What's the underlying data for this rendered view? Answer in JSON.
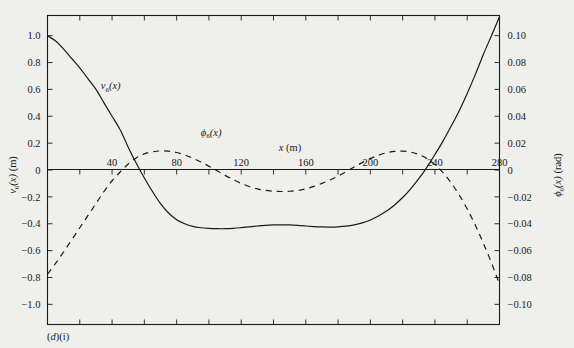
{
  "caption": "(d)(i)",
  "chart_data": {
    "type": "line",
    "title": "",
    "xlabel": "x (m)",
    "ylabel_left": "v₆(x) (m)",
    "ylabel_right": "ϕ₆(x) (rad)",
    "xlim": [
      0,
      280
    ],
    "ylim_left": [
      -1.15,
      1.15
    ],
    "ylim_right": [
      -0.115,
      0.115
    ],
    "grid": false,
    "legend": "inline-curve-labels",
    "xticks_major": [
      40,
      80,
      120,
      160,
      200,
      240,
      280
    ],
    "xticks_minor": [
      20,
      60,
      100,
      140,
      180,
      220,
      260
    ],
    "yticks_left": [
      "1.0",
      "0.8",
      "0.6",
      "0.4",
      "0.2",
      "0",
      "-0.2",
      "-0.4",
      "-0.6",
      "-0.8",
      "-1.0"
    ],
    "yticks_left_values": [
      1.0,
      0.8,
      0.6,
      0.4,
      0.2,
      0,
      -0.2,
      -0.4,
      -0.6,
      -0.8,
      -1.0
    ],
    "yticks_right": [
      "0.10",
      "0.08",
      "0.06",
      "0.04",
      "0.02",
      "0",
      "-0.02",
      "-0.04",
      "-0.06",
      "-0.08",
      "-0.10"
    ],
    "yticks_right_values": [
      0.1,
      0.08,
      0.06,
      0.04,
      0.02,
      0,
      -0.02,
      -0.04,
      -0.06,
      -0.08,
      -0.1
    ],
    "series": [
      {
        "name": "v6(x)",
        "label_html": "v<sub>6</sub>(x)",
        "style": "solid",
        "axis": "left",
        "units": "m",
        "label_pos": {
          "x": 33,
          "y": 0.6
        },
        "x": [
          0,
          5,
          10,
          15,
          20,
          25,
          30,
          35,
          40,
          45,
          50,
          55,
          60,
          65,
          70,
          75,
          80,
          85,
          90,
          95,
          100,
          105,
          110,
          115,
          120,
          125,
          130,
          135,
          140,
          145,
          150,
          155,
          160,
          165,
          170,
          175,
          180,
          185,
          190,
          195,
          200,
          205,
          210,
          215,
          220,
          225,
          230,
          235,
          240,
          245,
          250,
          255,
          260,
          265,
          270,
          275,
          280
        ],
        "y": [
          1.0,
          0.96,
          0.9,
          0.83,
          0.76,
          0.68,
          0.6,
          0.5,
          0.4,
          0.3,
          0.17,
          0.05,
          -0.06,
          -0.16,
          -0.25,
          -0.32,
          -0.37,
          -0.4,
          -0.42,
          -0.43,
          -0.435,
          -0.437,
          -0.437,
          -0.434,
          -0.429,
          -0.423,
          -0.417,
          -0.412,
          -0.409,
          -0.408,
          -0.409,
          -0.412,
          -0.417,
          -0.421,
          -0.424,
          -0.425,
          -0.423,
          -0.418,
          -0.408,
          -0.393,
          -0.372,
          -0.343,
          -0.306,
          -0.26,
          -0.205,
          -0.14,
          -0.065,
          0.02,
          0.115,
          0.215,
          0.325,
          0.44,
          0.57,
          0.71,
          0.86,
          1.0,
          1.14
        ]
      },
      {
        "name": "phi6(x)",
        "label_html": "ϕ<sub>6</sub>(x)",
        "style": "dashed",
        "axis": "right",
        "units": "rad",
        "label_pos": {
          "x": 95,
          "y": 0.0255
        },
        "x": [
          0,
          5,
          10,
          15,
          20,
          25,
          30,
          35,
          40,
          45,
          50,
          55,
          60,
          65,
          70,
          75,
          80,
          85,
          90,
          95,
          100,
          105,
          110,
          115,
          120,
          125,
          130,
          135,
          140,
          145,
          150,
          155,
          160,
          165,
          170,
          175,
          180,
          185,
          190,
          195,
          200,
          205,
          210,
          215,
          220,
          225,
          230,
          235,
          240,
          245,
          250,
          255,
          260,
          265,
          270,
          275,
          280
        ],
        "y": [
          -0.0775,
          -0.0695,
          -0.061,
          -0.052,
          -0.043,
          -0.034,
          -0.025,
          -0.016,
          -0.008,
          -0.0015,
          0.0045,
          0.009,
          0.012,
          0.0135,
          0.0142,
          0.014,
          0.013,
          0.0112,
          0.0088,
          0.006,
          0.0028,
          -0.0005,
          -0.004,
          -0.0072,
          -0.01,
          -0.0123,
          -0.014,
          -0.0152,
          -0.0158,
          -0.016,
          -0.0158,
          -0.0152,
          -0.014,
          -0.0122,
          -0.01,
          -0.0074,
          -0.0045,
          -0.0012,
          0.0022,
          0.0055,
          0.0085,
          0.011,
          0.0128,
          0.0138,
          0.014,
          0.0133,
          0.0115,
          0.0085,
          0.004,
          -0.002,
          -0.0095,
          -0.0185,
          -0.029,
          -0.041,
          -0.0545,
          -0.069,
          -0.085
        ]
      }
    ]
  }
}
